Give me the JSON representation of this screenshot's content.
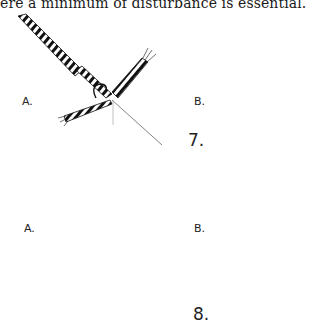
{
  "page": {
    "text_line": "ere a minimum of disturbance is essential."
  },
  "figures": [
    {
      "number": "7.",
      "panels": [
        {
          "label": "A."
        },
        {
          "label": "B."
        }
      ]
    },
    {
      "number": "8.",
      "panels": [
        {
          "label": "A."
        },
        {
          "label": "B."
        }
      ]
    }
  ]
}
